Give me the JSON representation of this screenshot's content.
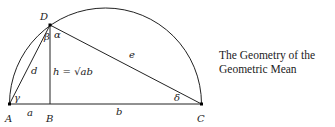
{
  "caption": {
    "line1": "The Geometry of the",
    "line2": "Geometric Mean"
  },
  "points": {
    "A": "A",
    "B": "B",
    "C": "C",
    "D": "D"
  },
  "segments": {
    "a": "a",
    "b": "b",
    "d": "d",
    "e": "e",
    "h": "h = √ab"
  },
  "angles": {
    "alpha": "α",
    "beta": "β",
    "gamma": "γ",
    "delta": "δ"
  },
  "colors": {
    "stroke": "#222222",
    "background": "#ffffff"
  }
}
